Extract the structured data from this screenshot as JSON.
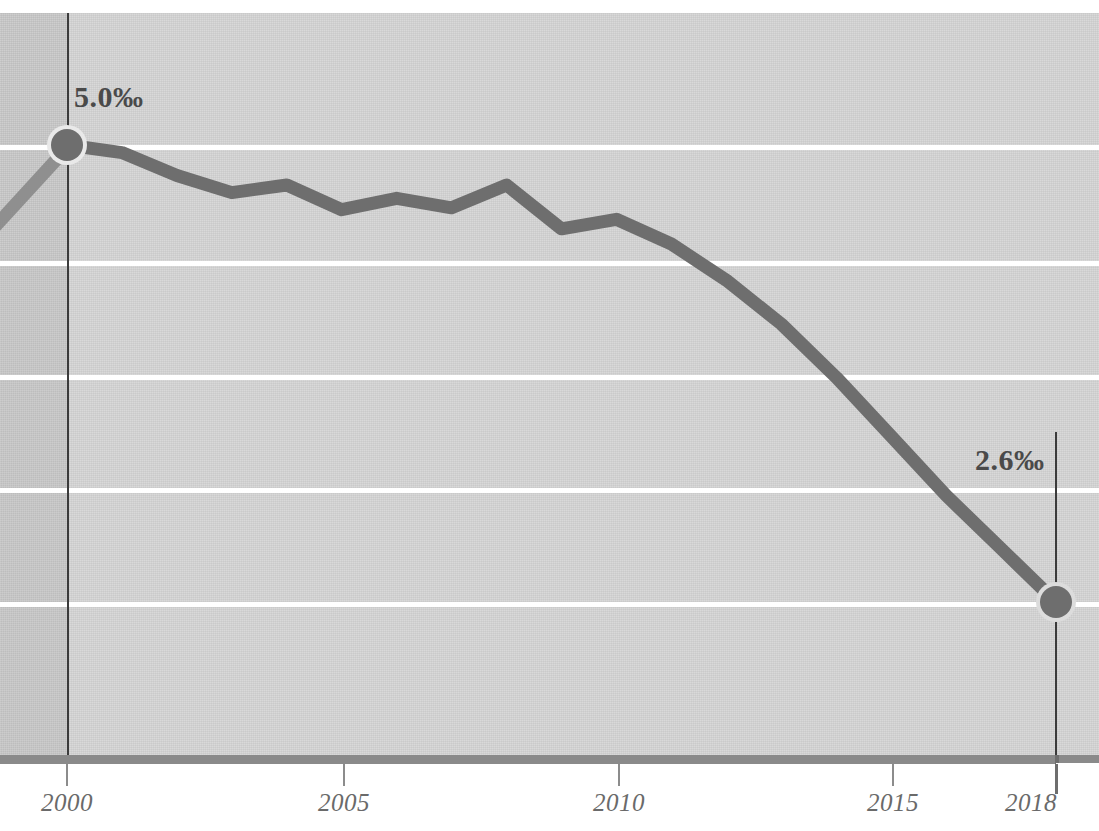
{
  "chart_data": {
    "type": "line",
    "title": "",
    "subtitle": "",
    "xlabel": "",
    "ylabel": "",
    "unit": "‰",
    "grid": true,
    "legend": null,
    "xlim": [
      2000,
      2018
    ],
    "ylim": [
      2.0,
      5.4
    ],
    "x_ticks": [
      2000,
      2005,
      2010,
      2015,
      2018
    ],
    "x_tick_labels": [
      "2000",
      "2005",
      "2010",
      "2015",
      "2018"
    ],
    "y_gridlines": [
      5.0,
      4.4,
      3.8,
      3.2,
      2.6
    ],
    "x": [
      2000,
      2001,
      2002,
      2003,
      2004,
      2005,
      2006,
      2007,
      2008,
      2009,
      2010,
      2011,
      2012,
      2013,
      2014,
      2015,
      2016,
      2017,
      2018
    ],
    "series": [
      {
        "name": "rate",
        "values": [
          5.0,
          4.96,
          4.84,
          4.75,
          4.79,
          4.66,
          4.72,
          4.67,
          4.79,
          4.56,
          4.61,
          4.48,
          4.29,
          4.06,
          3.78,
          3.47,
          3.16,
          2.88,
          2.6
        ]
      }
    ],
    "markers": [
      {
        "x": 2000,
        "y": 5.0,
        "label": "5.0‰"
      },
      {
        "x": 2018,
        "y": 2.6,
        "label": "2.6‰"
      }
    ],
    "annotations": {
      "start_value_label": "5.0‰",
      "end_value_label": "2.6‰"
    },
    "colors": {
      "line": "#6e6e6e",
      "marker": "#6e6e6e",
      "marker_ring": "#e8e8e8",
      "plot_background": "#d6d6d6",
      "pre_range_background": "#c9c9c9",
      "gridline": "#ffffff",
      "axis_bar": "#8a8a8a",
      "tick_label": "#6a6a6a",
      "callout_text": "#4a4a4a",
      "year_marker_line": "#3b3b3b"
    }
  },
  "axis": {
    "ticks": [
      {
        "label": "2000"
      },
      {
        "label": "2005"
      },
      {
        "label": "2010"
      },
      {
        "label": "2015"
      },
      {
        "label": "2018"
      }
    ]
  },
  "callouts": {
    "start": "5.0‰",
    "end": "2.6‰"
  }
}
